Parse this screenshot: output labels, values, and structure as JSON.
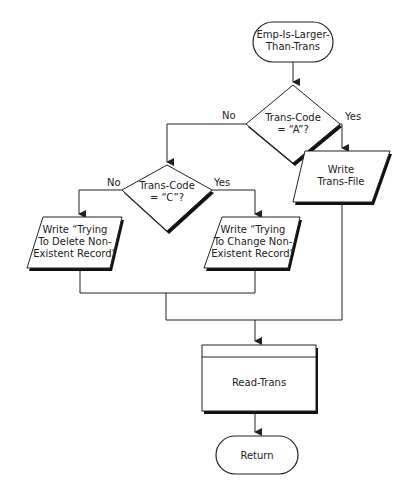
{
  "diagram": {
    "type": "flowchart",
    "nodes": {
      "start": {
        "shape": "terminal",
        "lines": [
          "Emp-Is-Larger-",
          "Than-Trans"
        ]
      },
      "decision_a": {
        "shape": "decision",
        "lines": [
          "Trans-Code",
          "= “A”?"
        ]
      },
      "decision_c": {
        "shape": "decision",
        "lines": [
          "Trans-Code",
          "= “C”?"
        ]
      },
      "write_trans_file": {
        "shape": "io",
        "lines": [
          "Write",
          "Trans-File"
        ]
      },
      "write_delete": {
        "shape": "io",
        "lines": [
          "Write “Trying",
          "To Delete Non-",
          "Existent Record”"
        ]
      },
      "write_change": {
        "shape": "io",
        "lines": [
          "Write “Trying",
          "To Change Non-",
          "Existent Record”"
        ]
      },
      "read_trans": {
        "shape": "predefined-process",
        "lines": [
          "Read-Trans"
        ]
      },
      "end": {
        "shape": "terminal",
        "lines": [
          "Return"
        ]
      }
    },
    "edge_labels": {
      "a_no": "No",
      "a_yes": "Yes",
      "c_no": "No",
      "c_yes": "Yes"
    },
    "edges": [
      {
        "from": "start",
        "to": "decision_a"
      },
      {
        "from": "decision_a",
        "to": "decision_c",
        "label": "No"
      },
      {
        "from": "decision_a",
        "to": "write_trans_file",
        "label": "Yes"
      },
      {
        "from": "decision_c",
        "to": "write_delete",
        "label": "No"
      },
      {
        "from": "decision_c",
        "to": "write_change",
        "label": "Yes"
      },
      {
        "from": "write_delete",
        "to": "read_trans"
      },
      {
        "from": "write_change",
        "to": "read_trans"
      },
      {
        "from": "write_trans_file",
        "to": "read_trans"
      },
      {
        "from": "read_trans",
        "to": "end"
      }
    ]
  }
}
